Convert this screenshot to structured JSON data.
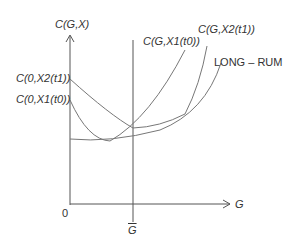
{
  "diagram": {
    "y_axis_label": "C(G,X)",
    "x_axis_label": "G",
    "origin_label": "0",
    "gbar_label": "G",
    "curves": [
      {
        "id": "x2t1_left",
        "label": "C(0,X2(t1))"
      },
      {
        "id": "x1t0_left",
        "label": "C(0,X1(t0))"
      },
      {
        "id": "x1t0_right",
        "label": "C(G,X1(t0))"
      },
      {
        "id": "x2t1_right",
        "label": "C(G,X2(t1))"
      },
      {
        "id": "long_run",
        "label": "LONG – RUM"
      }
    ],
    "colors": {
      "axis": "#555555",
      "curve": "#777777",
      "text": "#333333"
    }
  }
}
